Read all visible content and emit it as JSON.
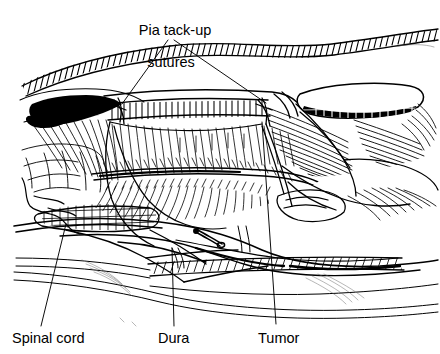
{
  "figure": {
    "type": "medical-line-illustration",
    "background_color": "#ffffff",
    "ink_color": "#000000"
  },
  "labels": {
    "pia_tack_up_line1": "Pia tack-up",
    "pia_tack_up_line2": "sutures",
    "spinal_cord": "Spinal cord",
    "dura": "Dura",
    "tumor": "Tumor"
  },
  "annotations": [
    {
      "name": "pia-tack-up-sutures",
      "text": "Pia tack-up sutures",
      "label_x": 170,
      "label_y": 10,
      "leaders": [
        {
          "from": [
            168,
            40
          ],
          "to": [
            122,
            104
          ]
        },
        {
          "from": [
            174,
            40
          ],
          "to": [
            266,
            103
          ]
        }
      ]
    },
    {
      "name": "spinal-cord",
      "text": "Spinal cord",
      "label_x": 12,
      "label_y": 331,
      "leaders": [
        {
          "from": [
            41,
            326
          ],
          "to": [
            66,
            224
          ]
        }
      ]
    },
    {
      "name": "dura",
      "text": "Dura",
      "label_x": 158,
      "label_y": 331,
      "leaders": [
        {
          "from": [
            174,
            326
          ],
          "to": [
            172,
            248
          ]
        }
      ]
    },
    {
      "name": "tumor",
      "text": "Tumor",
      "label_x": 258,
      "label_y": 331,
      "leaders": [
        {
          "from": [
            276,
            324
          ],
          "to": [
            262,
            122
          ]
        }
      ]
    }
  ],
  "anatomy": {
    "top_hatched_band": "wavy hatched fascia / muscle edge across top of field",
    "dural_edge_band": "hatched dura edge band suspended by tack-up sutures",
    "spinal_cord_surface": "dense radiating hatch lines with midline fissure",
    "dura_flap_right": "retracted dura flap, white oval with stippled undersurface",
    "dark_wedge_left": "solid black shadowed dural edge at left",
    "needle": "suture needle at lower center",
    "lower_contours": "thin double contour lines of the surgical field floor"
  }
}
